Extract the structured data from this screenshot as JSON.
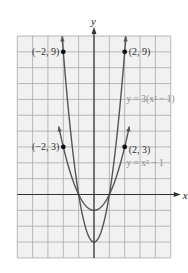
{
  "chart_data": {
    "type": "line",
    "title": "",
    "xlabel": "x",
    "ylabel": "y",
    "xlim": [
      -5,
      5
    ],
    "ylim": [
      -4,
      10
    ],
    "grid": true,
    "grid_step": 1,
    "legend_position": "inline labels",
    "series": [
      {
        "name": "y = 3(x² − 1)",
        "expression": "3*(x^2-1)",
        "label_pos": [
          2.5,
          6.0
        ],
        "x_range": [
          -2.08,
          2.08
        ],
        "color": "#555555",
        "points": [
          [
            -2,
            9
          ],
          [
            2,
            9
          ]
        ]
      },
      {
        "name": "y = x² − 1",
        "expression": "x^2-1",
        "label_pos": [
          2.5,
          2.0
        ],
        "x_range": [
          -2.3,
          2.3
        ],
        "color": "#555555",
        "points": [
          [
            -2,
            3
          ],
          [
            2,
            3
          ]
        ]
      }
    ],
    "annotations": [
      {
        "text": "(−2, 9)",
        "x": -2,
        "y": 9,
        "anchor": "left"
      },
      {
        "text": "(2, 9)",
        "x": 2,
        "y": 9,
        "anchor": "right"
      },
      {
        "text": "(−2, 3)",
        "x": -2,
        "y": 3,
        "anchor": "left"
      },
      {
        "text": "(2, 3)",
        "x": 2,
        "y": 3,
        "anchor": "right-below"
      }
    ]
  },
  "style": {
    "grid_bg": "#f1f1f1",
    "grid_line": "#a8a8a8",
    "axis_color": "#333333",
    "curve_color": "#555555",
    "point_color": "#111111",
    "label_color": "#8a8a8a"
  }
}
